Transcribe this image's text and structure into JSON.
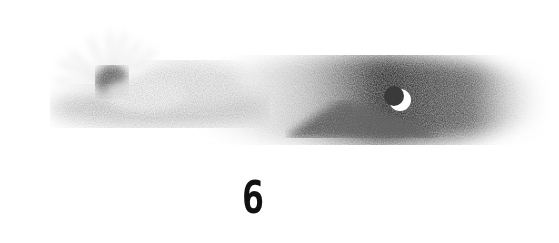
{
  "illustration": {
    "description": "Pencil sketch of a sun rising behind a bright cloud on the left, transitioning into a dark night sky with a crescent moon over a dark cloud on the right",
    "elements": [
      "sun-with-rays",
      "light-cloud",
      "dark-sky",
      "crescent-moon",
      "dark-cloud"
    ]
  },
  "caption": {
    "number": "6"
  }
}
